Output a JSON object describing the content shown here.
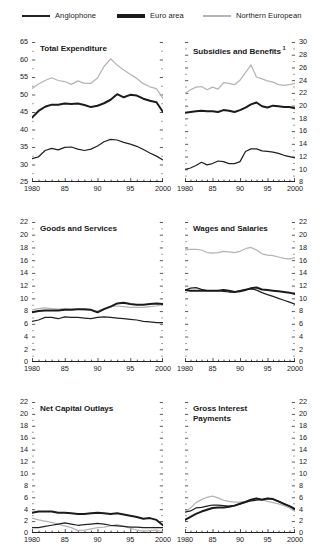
{
  "figure": {
    "series_names": [
      "Anglophone",
      "Euro area",
      "Northern European"
    ],
    "colors": {
      "anglophone": "#222222",
      "euro_area": "#1b1b1b",
      "northern_european": "#b4b4b4"
    }
  },
  "legend": {
    "items": [
      {
        "label": "Anglophone",
        "key": "anglophone"
      },
      {
        "label": "Euro area",
        "key": "euro_area"
      },
      {
        "label": "Northern European",
        "key": "northern_european"
      }
    ]
  },
  "chart_data": [
    {
      "type": "line",
      "panel": 1,
      "title": "Total Expenditure",
      "footnote_marker": "",
      "xlabel": "",
      "ylabel": "",
      "axis_side": "left",
      "xlim": [
        1980,
        2000
      ],
      "ylim": [
        25,
        65
      ],
      "yticks": [
        25,
        30,
        35,
        40,
        45,
        50,
        55,
        60,
        65
      ],
      "xticks": [
        1980,
        1985,
        1990,
        1995,
        2000
      ],
      "xticklabels": [
        "1980",
        "85",
        "90",
        "95",
        "2000"
      ],
      "grid": false,
      "legend_position": "figure-top",
      "x": [
        1980,
        1981,
        1982,
        1983,
        1984,
        1985,
        1986,
        1987,
        1988,
        1989,
        1990,
        1991,
        1992,
        1993,
        1994,
        1995,
        1996,
        1997,
        1998,
        1999,
        2000
      ],
      "series": [
        {
          "name": "Anglophone",
          "values": [
            31.7,
            32.2,
            34.0,
            34.6,
            34.2,
            34.9,
            35.0,
            34.4,
            34.0,
            34.4,
            35.3,
            36.5,
            37.2,
            37.0,
            36.3,
            35.8,
            35.2,
            34.3,
            33.3,
            32.4,
            31.3
          ]
        },
        {
          "name": "Euro area",
          "values": [
            43.4,
            45.3,
            46.5,
            47.1,
            47.1,
            47.4,
            47.3,
            47.4,
            47.0,
            46.4,
            46.8,
            47.5,
            48.5,
            50.1,
            49.2,
            49.9,
            49.7,
            48.8,
            48.2,
            47.8,
            45.0
          ]
        },
        {
          "name": "Northern European",
          "values": [
            51.7,
            53.0,
            54.0,
            54.8,
            54.0,
            53.7,
            52.9,
            53.9,
            53.2,
            53.2,
            54.7,
            58.0,
            60.2,
            58.4,
            57.0,
            55.8,
            54.6,
            53.1,
            52.2,
            51.7,
            48.9
          ]
        }
      ]
    },
    {
      "type": "line",
      "panel": 2,
      "title": "Subsidies and Benefits",
      "footnote_marker": "1",
      "xlabel": "",
      "ylabel": "",
      "axis_side": "right",
      "xlim": [
        1980,
        2000
      ],
      "ylim": [
        8,
        30
      ],
      "yticks": [
        8,
        10,
        12,
        14,
        16,
        18,
        20,
        22,
        24,
        26,
        28,
        30
      ],
      "xticks": [
        1980,
        1985,
        1990,
        1995,
        2000
      ],
      "xticklabels": [
        "1980",
        "85",
        "90",
        "95",
        "2000"
      ],
      "grid": false,
      "legend_position": "figure-top",
      "x": [
        1980,
        1981,
        1982,
        1983,
        1984,
        1985,
        1986,
        1987,
        1988,
        1989,
        1990,
        1991,
        1992,
        1993,
        1994,
        1995,
        1996,
        1997,
        1998,
        1999,
        2000
      ],
      "series": [
        {
          "name": "Anglophone",
          "values": [
            10.0,
            10.2,
            10.6,
            11.1,
            10.7,
            10.9,
            11.3,
            11.2,
            10.9,
            10.9,
            11.2,
            12.8,
            13.2,
            13.2,
            12.9,
            12.8,
            12.7,
            12.5,
            12.2,
            12.0,
            11.8
          ]
        },
        {
          "name": "Euro area",
          "values": [
            18.9,
            19.0,
            19.1,
            19.2,
            19.1,
            19.1,
            19.0,
            19.3,
            19.2,
            19.0,
            19.3,
            19.7,
            20.2,
            20.5,
            19.9,
            19.7,
            20.0,
            19.9,
            19.8,
            19.8,
            19.6
          ]
        },
        {
          "name": "Northern European",
          "values": [
            21.9,
            22.5,
            22.9,
            23.0,
            22.5,
            22.9,
            22.6,
            23.6,
            23.5,
            23.3,
            24.0,
            25.2,
            26.4,
            24.5,
            24.2,
            23.9,
            23.7,
            23.3,
            23.2,
            23.3,
            23.5
          ]
        }
      ]
    },
    {
      "type": "line",
      "panel": 3,
      "title": "Goods and Services",
      "footnote_marker": "",
      "xlabel": "",
      "ylabel": "",
      "axis_side": "left",
      "xlim": [
        1980,
        2000
      ],
      "ylim": [
        0,
        22
      ],
      "yticks": [
        0,
        2,
        4,
        6,
        8,
        10,
        12,
        14,
        16,
        18,
        20,
        22
      ],
      "xticks": [
        1980,
        1985,
        1990,
        1995,
        2000
      ],
      "xticklabels": [
        "1980",
        "85",
        "90",
        "95",
        "2000"
      ],
      "grid": false,
      "legend_position": "figure-top",
      "x": [
        1980,
        1981,
        1982,
        1983,
        1984,
        1985,
        1986,
        1987,
        1988,
        1989,
        1990,
        1991,
        1992,
        1993,
        1994,
        1995,
        1996,
        1997,
        1998,
        1999,
        2000
      ],
      "series": [
        {
          "name": "Anglophone",
          "values": [
            6.4,
            6.6,
            7.0,
            7.0,
            6.8,
            7.1,
            7.0,
            7.0,
            6.9,
            6.8,
            7.0,
            7.1,
            7.0,
            6.9,
            6.8,
            6.7,
            6.6,
            6.4,
            6.3,
            6.2,
            6.2
          ]
        },
        {
          "name": "Euro area",
          "values": [
            7.8,
            8.0,
            8.1,
            8.1,
            8.1,
            8.2,
            8.2,
            8.3,
            8.3,
            8.2,
            7.8,
            8.3,
            8.7,
            9.2,
            9.3,
            9.1,
            9.0,
            9.0,
            9.1,
            9.2,
            9.1
          ]
        },
        {
          "name": "Northern European",
          "values": [
            8.2,
            8.4,
            8.5,
            8.4,
            8.3,
            8.4,
            8.3,
            8.3,
            8.2,
            8.2,
            8.0,
            8.4,
            8.7,
            8.8,
            8.7,
            8.6,
            8.6,
            8.6,
            8.7,
            8.8,
            9.0
          ]
        }
      ]
    },
    {
      "type": "line",
      "panel": 4,
      "title": "Wages and Salaries",
      "footnote_marker": "",
      "xlabel": "",
      "ylabel": "",
      "axis_side": "right",
      "xlim": [
        1980,
        2000
      ],
      "ylim": [
        0,
        22
      ],
      "yticks": [
        0,
        2,
        4,
        6,
        8,
        10,
        12,
        14,
        16,
        18,
        20,
        22
      ],
      "xticks": [
        1980,
        1985,
        1990,
        1995,
        2000
      ],
      "xticklabels": [
        "1980",
        "85",
        "90",
        "95",
        "2000"
      ],
      "grid": false,
      "legend_position": "figure-top",
      "x": [
        1980,
        1981,
        1982,
        1983,
        1984,
        1985,
        1986,
        1987,
        1988,
        1989,
        1990,
        1991,
        1992,
        1993,
        1994,
        1995,
        1996,
        1997,
        1998,
        1999,
        2000
      ],
      "series": [
        {
          "name": "Anglophone",
          "values": [
            11.3,
            11.6,
            11.7,
            11.4,
            11.2,
            11.2,
            11.2,
            11.1,
            11.0,
            11.0,
            11.2,
            11.4,
            11.5,
            11.3,
            10.9,
            10.6,
            10.3,
            10.0,
            9.7,
            9.4,
            9.1
          ]
        },
        {
          "name": "Euro area",
          "values": [
            11.3,
            11.2,
            11.2,
            11.2,
            11.2,
            11.2,
            11.2,
            11.3,
            11.2,
            11.0,
            11.1,
            11.3,
            11.6,
            11.7,
            11.4,
            11.3,
            11.2,
            11.1,
            11.0,
            10.9,
            10.7
          ]
        },
        {
          "name": "Northern European",
          "values": [
            17.6,
            17.7,
            17.7,
            17.6,
            17.2,
            17.1,
            17.2,
            17.4,
            17.3,
            17.2,
            17.4,
            17.8,
            18.0,
            17.6,
            17.0,
            16.8,
            16.7,
            16.5,
            16.3,
            16.2,
            16.4
          ]
        }
      ]
    },
    {
      "type": "line",
      "panel": 5,
      "title": "Net Capital Outlays",
      "footnote_marker": "",
      "xlabel": "",
      "ylabel": "",
      "axis_side": "left",
      "xlim": [
        1980,
        2000
      ],
      "ylim": [
        0,
        22
      ],
      "yticks": [
        0,
        2,
        4,
        6,
        8,
        10,
        12,
        14,
        16,
        18,
        20,
        22
      ],
      "xticks": [
        1980,
        1985,
        1990,
        1995,
        2000
      ],
      "xticklabels": [
        "1980",
        "85",
        "90",
        "95",
        "2000"
      ],
      "grid": false,
      "legend_position": "figure-top",
      "x": [
        1980,
        1981,
        1982,
        1983,
        1984,
        1985,
        1986,
        1987,
        1988,
        1989,
        1990,
        1991,
        1992,
        1993,
        1994,
        1995,
        1996,
        1997,
        1998,
        1999,
        2000
      ],
      "series": [
        {
          "name": "Anglophone",
          "values": [
            0.9,
            0.9,
            1.1,
            1.3,
            1.5,
            1.7,
            1.5,
            1.3,
            1.4,
            1.5,
            1.6,
            1.5,
            1.3,
            1.2,
            1.1,
            1.0,
            1.0,
            0.9,
            0.9,
            0.9,
            0.9
          ]
        },
        {
          "name": "Euro area",
          "values": [
            3.4,
            3.6,
            3.6,
            3.6,
            3.4,
            3.4,
            3.3,
            3.2,
            3.2,
            3.3,
            3.4,
            3.3,
            3.2,
            3.3,
            3.1,
            2.9,
            2.7,
            2.4,
            2.5,
            2.2,
            1.3
          ]
        },
        {
          "name": "Northern European",
          "values": [
            2.5,
            2.2,
            2.0,
            1.8,
            1.5,
            1.2,
            0.9,
            0.4,
            0.5,
            0.7,
            0.9,
            1.0,
            1.2,
            1.4,
            1.1,
            0.8,
            0.5,
            0.3,
            0.4,
            0.5,
            0.2
          ]
        }
      ]
    },
    {
      "type": "line",
      "panel": 6,
      "title": "Gross Interest\nPayments",
      "footnote_marker": "",
      "xlabel": "",
      "ylabel": "",
      "axis_side": "right",
      "xlim": [
        1980,
        2000
      ],
      "ylim": [
        0,
        22
      ],
      "yticks": [
        0,
        2,
        4,
        6,
        8,
        10,
        12,
        14,
        16,
        18,
        20,
        22
      ],
      "xticks": [
        1980,
        1985,
        1990,
        1995,
        2000
      ],
      "xticklabels": [
        "1980",
        "85",
        "90",
        "95",
        "2000"
      ],
      "grid": false,
      "legend_position": "figure-top",
      "x": [
        1980,
        1981,
        1982,
        1983,
        1984,
        1985,
        1986,
        1987,
        1988,
        1989,
        1990,
        1991,
        1992,
        1993,
        1994,
        1995,
        1996,
        1997,
        1998,
        1999,
        2000
      ],
      "series": [
        {
          "name": "Anglophone",
          "values": [
            3.5,
            3.7,
            4.2,
            4.3,
            4.5,
            4.7,
            4.7,
            4.6,
            4.5,
            4.6,
            4.9,
            5.2,
            5.4,
            5.5,
            5.6,
            5.8,
            5.7,
            5.3,
            4.9,
            4.5,
            4.1
          ]
        },
        {
          "name": "Euro area",
          "values": [
            2.2,
            2.7,
            3.2,
            3.6,
            3.9,
            4.2,
            4.3,
            4.3,
            4.4,
            4.6,
            4.9,
            5.2,
            5.6,
            5.8,
            5.6,
            5.8,
            5.7,
            5.3,
            4.9,
            4.5,
            4.0
          ]
        },
        {
          "name": "Northern European",
          "values": [
            3.6,
            4.2,
            5.1,
            5.6,
            6.0,
            6.2,
            5.9,
            5.5,
            5.3,
            5.2,
            5.2,
            5.3,
            5.5,
            5.8,
            5.6,
            5.3,
            5.1,
            4.9,
            4.6,
            4.2,
            3.6
          ]
        }
      ]
    }
  ]
}
